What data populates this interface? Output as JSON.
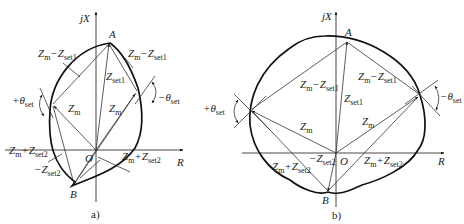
{
  "figure_a": {
    "caption": "a)",
    "axis_y": "jX",
    "axis_x": "R",
    "origin": "O",
    "point_a": "A",
    "point_b": "B",
    "labels": {
      "zm_minus_zset1_left": {
        "main": "Z",
        "s1": "m",
        "op": "−Z",
        "s2": "set1"
      },
      "zm_minus_zset1_right": {
        "main": "Z",
        "s1": "m",
        "op": "−Z",
        "s2": "set1"
      },
      "zset1": {
        "main": "Z",
        "s1": "set1"
      },
      "zm_left": {
        "main": "Z",
        "s1": "m"
      },
      "zm_right": {
        "main": "Z",
        "s1": "m"
      },
      "plus_theta": {
        "main": "+θ",
        "s1": "set"
      },
      "minus_theta": {
        "main": "−θ",
        "s1": "set"
      },
      "zm_plus_zset2_left": {
        "main": "Z",
        "s1": "m",
        "op": "+Z",
        "s2": "set2"
      },
      "zm_plus_zset2_right": {
        "main": "Z",
        "s1": "m",
        "op": "+Z",
        "s2": "set2"
      },
      "minus_zset2": {
        "main": "−Z",
        "s1": "set2"
      }
    }
  },
  "figure_b": {
    "caption": "b)",
    "axis_y": "jX",
    "axis_x": "R",
    "origin": "O",
    "point_a": "A",
    "point_b": "B",
    "labels": {
      "zm_minus_zset1_left": {
        "main": "Z",
        "s1": "m",
        "op": "−Z",
        "s2": "set1"
      },
      "zm_minus_zset1_right": {
        "main": "Z",
        "s1": "m",
        "op": "−Z",
        "s2": "set1"
      },
      "zset1": {
        "main": "Z",
        "s1": "set1"
      },
      "zm_left": {
        "main": "Z",
        "s1": "m"
      },
      "zm_right": {
        "main": "Z",
        "s1": "m"
      },
      "plus_theta": {
        "main": "+θ",
        "s1": "set"
      },
      "minus_theta": {
        "main": "−θ",
        "s1": "set"
      },
      "zm_plus_zset2_left": {
        "main": "Z",
        "s1": "m",
        "op": "+Z",
        "s2": "set2"
      },
      "zm_plus_zset2_right": {
        "main": "Z",
        "s1": "m",
        "op": "+Z",
        "s2": "set2"
      },
      "minus_zset2": {
        "main": "−Z",
        "s1": "set2"
      }
    }
  }
}
